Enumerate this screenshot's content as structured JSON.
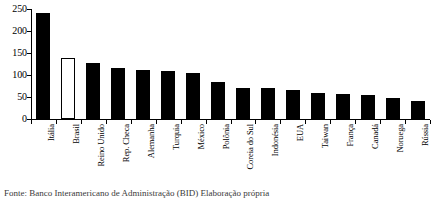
{
  "chart_data": {
    "type": "bar",
    "title": "",
    "subtitle": "",
    "xlabel": "",
    "ylabel": "",
    "ylim": [
      0,
      250
    ],
    "yticks": [
      0,
      50,
      100,
      150,
      200,
      250
    ],
    "grid": false,
    "legend": "none",
    "categories": [
      "Itália",
      "Brasil",
      "Reino Unido",
      "Rep. Checa",
      "Alemanha",
      "Turquia",
      "México",
      "Polônia",
      "Coreia do Sul",
      "Indonésia",
      "EUA",
      "Taiwan",
      "França",
      "Canadá",
      "Noruega",
      "Rússia"
    ],
    "values": [
      240,
      138,
      128,
      117,
      111,
      110,
      104,
      85,
      70,
      70,
      66,
      60,
      57,
      54,
      48,
      40
    ],
    "bar_styles": [
      "filled",
      "hollow",
      "filled",
      "filled",
      "filled",
      "filled",
      "filled",
      "filled",
      "filled",
      "filled",
      "filled",
      "filled",
      "filled",
      "filled",
      "filled",
      "filled"
    ],
    "colors": {
      "bar_fill": "#000000",
      "bar_highlight_fill": "#ffffff",
      "bar_stroke": "#000000",
      "axis": "#000000",
      "background": "#ffffff"
    },
    "highlight_category": "Brasil"
  },
  "caption": {
    "text": "Fonte: Banco Interamericano de Administração (BID) Elaboração própria"
  }
}
